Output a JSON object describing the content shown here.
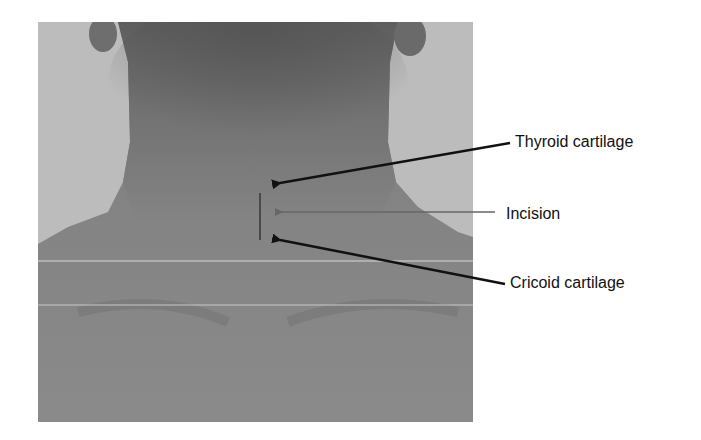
{
  "figure": {
    "labels": [
      {
        "text": "Thyroid cartilage",
        "x": 515,
        "y": 133
      },
      {
        "text": "Incision",
        "x": 506,
        "y": 205
      },
      {
        "text": "Cricoid cartilage",
        "x": 510,
        "y": 274
      }
    ],
    "colors": {
      "arrow": "#111111",
      "incision_arrow": "#555555",
      "incision_mark": "#4a4a4a",
      "text": "#111111"
    }
  }
}
